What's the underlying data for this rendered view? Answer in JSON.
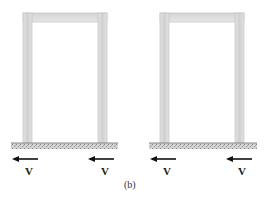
{
  "figure": {
    "caption": "(b)",
    "frames": [
      {
        "id": "frame-left",
        "labels": [
          "V",
          "V"
        ]
      },
      {
        "id": "frame-right",
        "labels": [
          "V",
          "V"
        ]
      }
    ]
  },
  "colors": {
    "member_fill": "#dcdcdc",
    "member_edge": "#b8b8b8",
    "ground": "#999999",
    "arrow": "#111111"
  }
}
